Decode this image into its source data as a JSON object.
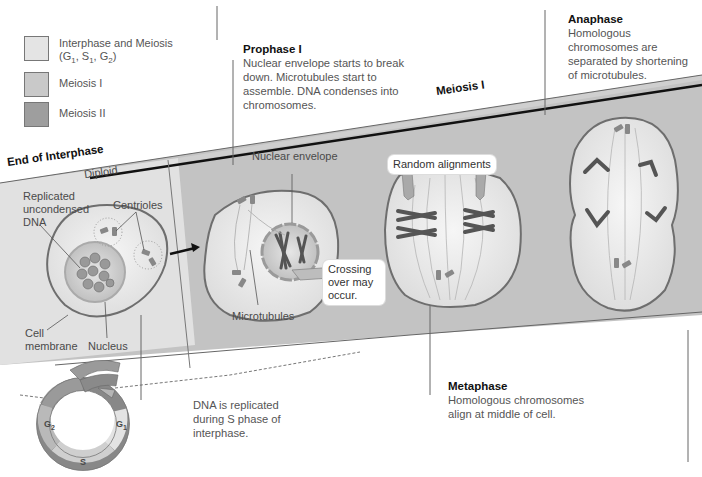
{
  "legend": {
    "items": [
      {
        "label_line1": "Interphase and Meiosis",
        "label_line2": "(G1, S1, G2)",
        "color": "#e4e4e4"
      },
      {
        "label_line1": "Meiosis I",
        "color": "#c9c9c9"
      },
      {
        "label_line1": "Meiosis II",
        "color": "#9e9e9e"
      }
    ]
  },
  "band": {
    "label_end_interphase": "End of Interphase",
    "label_diploid": "Diploid",
    "label_meiosis_i": "Meiosis I",
    "interphase_color": "#e2e2e2",
    "meiosis_i_color": "#c4c4c4"
  },
  "phases": {
    "prophase": {
      "title": "Prophase I",
      "description": "Nuclear envelope starts to break down. Microtubules start to assemble. DNA condenses into chromosomes."
    },
    "anaphase": {
      "title": "Anaphase",
      "description": "Homologous chromosomes are separated by shortening of microtubules."
    },
    "metaphase": {
      "title": "Metaphase",
      "description": "Homologous chromosomes align at middle of cell."
    },
    "interphase_note": "DNA is replicated during S phase of interphase."
  },
  "labels": {
    "replicated_dna": "Replicated uncondensed DNA",
    "centrioles": "Centrioles",
    "cell_membrane_1": "Cell",
    "cell_membrane_2": "membrane",
    "nucleus": "Nucleus",
    "nuclear_envelope": "Nuclear envelope",
    "microtubules": "Microtubules",
    "crossing_over": "Crossing over may occur.",
    "random_alignments": "Random alignments"
  },
  "cell_cycle": {
    "segments": [
      "G2",
      "S",
      "G1"
    ]
  }
}
